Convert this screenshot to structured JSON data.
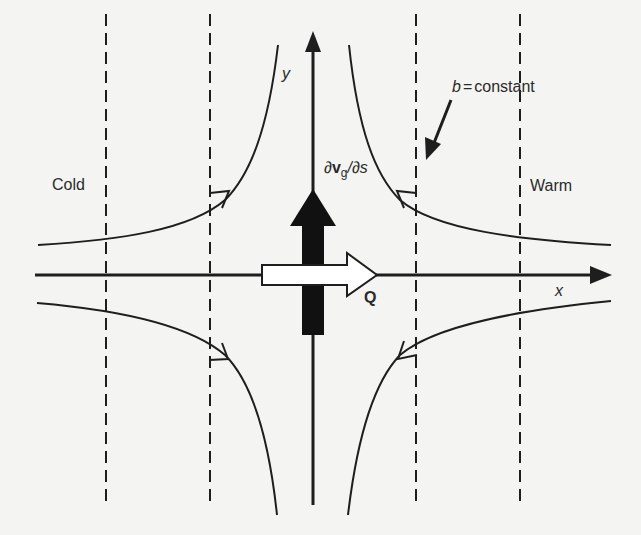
{
  "diagram": {
    "type": "deformation-field-schematic",
    "labels": {
      "cold": "Cold",
      "warm": "Warm",
      "x_axis": "x",
      "y_axis": "y",
      "b_constant": "b = constant",
      "b_symbol": "b",
      "b_equals": "=",
      "b_word": "constant",
      "dvg_ds_prefix": "∂",
      "dvg_ds_v": "v",
      "dvg_ds_sub": "g",
      "dvg_ds_suffix": "/∂s",
      "q_vector": "Q"
    },
    "elements": {
      "isentropes": {
        "count": 4,
        "style": "dashed",
        "x_positions": [
          106,
          210,
          416,
          520
        ]
      },
      "streamlines": {
        "count": 4,
        "shape": "hyperbolic",
        "flow": "inflow along y, outflow along x"
      },
      "thick_arrow": {
        "label": "∂vg/∂s",
        "direction": "up",
        "fill": "#111111"
      },
      "hollow_arrow": {
        "label": "Q",
        "direction": "right",
        "fill": "#ffffff"
      }
    },
    "colors": {
      "background": "#f4f4f2",
      "ink": "#1e1e1e"
    }
  }
}
